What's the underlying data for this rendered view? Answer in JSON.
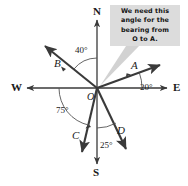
{
  "figure": {
    "origin_label": "O",
    "compass": {
      "north": "N",
      "south": "S",
      "east": "E",
      "west": "W"
    },
    "rays": [
      {
        "id": "A",
        "label": "A",
        "angle_label": "20°",
        "angle_deg": 20,
        "measured_from": "East axis",
        "direction": "up-right"
      },
      {
        "id": "B",
        "label": "B",
        "angle_label": "40°",
        "angle_deg": 40,
        "measured_from": "North axis",
        "direction": "up-left"
      },
      {
        "id": "C",
        "label": "C",
        "angle_label": "75°",
        "angle_deg": 75,
        "measured_from": "West axis",
        "direction": "down-left"
      },
      {
        "id": "D",
        "label": "D",
        "angle_label": "25°",
        "angle_deg": 25,
        "measured_from": "South axis",
        "direction": "down-right"
      }
    ],
    "callout": {
      "text": "We need this angle for the bearing from O to A.",
      "lines": [
        "We need this",
        "angle for the",
        "bearing from",
        "O to A."
      ],
      "background_color": "#dcdcdc",
      "points_to": "angle between North axis and ray A"
    },
    "colors": {
      "stroke": "#3a3a3a",
      "axis": "#3a3a3a",
      "arc": "#555555",
      "callout_bg": "#dcdcdc",
      "callout_tail": "#cfcfcf",
      "background": "#ffffff"
    }
  },
  "chart_data": {
    "type": "diagram",
    "origin": {
      "x": 97,
      "y": 88,
      "label": "O"
    },
    "axes": [
      "N",
      "E",
      "S",
      "W"
    ],
    "annotations": [
      {
        "label": "40°",
        "between": [
          "N",
          "B"
        ]
      },
      {
        "label": "20°",
        "between": [
          "E",
          "A"
        ]
      },
      {
        "label": "75°",
        "between": [
          "W",
          "C"
        ]
      },
      {
        "label": "25°",
        "between": [
          "S",
          "D"
        ]
      }
    ]
  }
}
